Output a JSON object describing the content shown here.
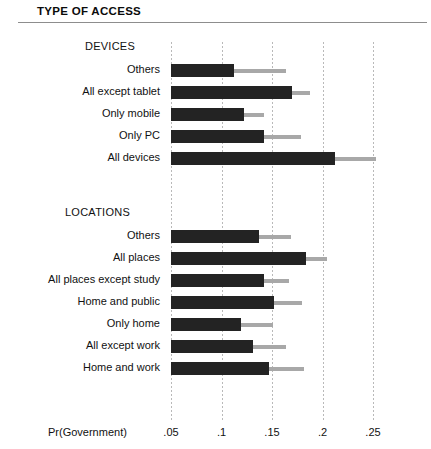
{
  "header": {
    "title": "TYPE OF ACCESS"
  },
  "axis": {
    "title": "Pr(Government)",
    "ticks": [
      ".05",
      ".1",
      ".15",
      ".2",
      ".25"
    ],
    "tick_values": [
      0.05,
      0.1,
      0.15,
      0.2,
      0.25
    ]
  },
  "sections": [
    {
      "label": "DEVICES"
    },
    {
      "label": "LOCATIONS"
    }
  ],
  "chart_data": {
    "type": "bar",
    "orientation": "horizontal",
    "title": "TYPE OF ACCESS",
    "xlabel": "Pr(Government)",
    "ylabel": "",
    "xlim": [
      0.05,
      0.265
    ],
    "xticks": [
      0.05,
      0.1,
      0.15,
      0.2,
      0.25
    ],
    "xticklabels": [
      ".05",
      ".1",
      ".15",
      ".2",
      ".25"
    ],
    "grid": "vertical-dotted",
    "legend": "none",
    "bar_baseline": 0.05,
    "series": [
      {
        "name": "Predicted probability",
        "color": "#232323"
      },
      {
        "name": "Confidence interval upper",
        "color": "#a8a8a8"
      }
    ],
    "groups": [
      {
        "group": "DEVICES",
        "categories": [
          "Others",
          "All except tablet",
          "Only mobile",
          "Only PC",
          "All devices"
        ],
        "values": [
          0.112,
          0.17,
          0.122,
          0.142,
          0.212
        ],
        "ci_upper": [
          0.164,
          0.188,
          0.142,
          0.179,
          0.253
        ]
      },
      {
        "group": "LOCATIONS",
        "categories": [
          "Others",
          "All places",
          "All places except study",
          "Home and public",
          "Only home",
          "All except work",
          "Home and work"
        ],
        "values": [
          0.137,
          0.184,
          0.142,
          0.152,
          0.119,
          0.131,
          0.147
        ],
        "ci_upper": [
          0.169,
          0.204,
          0.167,
          0.18,
          0.151,
          0.164,
          0.182
        ]
      }
    ]
  }
}
